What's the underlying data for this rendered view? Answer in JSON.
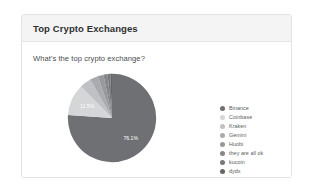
{
  "card": {
    "title": "Top Crypto Exchanges",
    "question": "What's the top crypto exchange?"
  },
  "legend": {
    "pager": {
      "page_text": "1/2",
      "up_icon": "caret-up-icon",
      "down_icon": "caret-down-icon"
    }
  },
  "colors": {
    "slice_1": "#6e7074",
    "slice_2": "#d4d6d8",
    "slice_3": "#bfc1c4",
    "slice_4": "#a9abaf",
    "slice_5": "#97999d",
    "slice_6": "#85878b",
    "slice_7": "#76787c",
    "slice_8": "#646669",
    "header_bg": "#f4f4f4",
    "card_border": "#e3e3e3",
    "text": "#4a4c50"
  },
  "chart_data": {
    "type": "pie",
    "title": "What's the top crypto exchange?",
    "labels": [
      "Binance",
      "Coinbase",
      "Kraken",
      "Gemini",
      "Huobi",
      "they are all ok",
      "kucoin",
      "dydx"
    ],
    "values": [
      76.1,
      11.5,
      4.2,
      3.0,
      2.1,
      1.5,
      1.0,
      0.6
    ],
    "value_suffix": "%",
    "visible_labels": [
      {
        "text": "76.1%",
        "slice": "Binance"
      },
      {
        "text": "11.5%",
        "slice": "Coinbase"
      }
    ],
    "colors": [
      "#6e7074",
      "#d4d6d8",
      "#bfc1c4",
      "#a9abaf",
      "#97999d",
      "#85878b",
      "#76787c",
      "#646669"
    ],
    "legend_position": "right",
    "grid": false
  }
}
